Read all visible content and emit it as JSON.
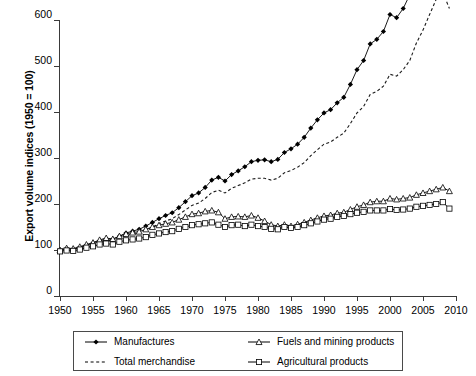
{
  "chart_data": {
    "type": "line",
    "title": "",
    "xlabel": "",
    "ylabel": "Export volume indices (1950 = 100)",
    "xlim": [
      1950,
      2010
    ],
    "ylim": [
      0,
      600
    ],
    "xticks": [
      1950,
      1955,
      1960,
      1965,
      1970,
      1975,
      1980,
      1985,
      1990,
      1995,
      2000,
      2005,
      2010
    ],
    "yticks": [
      0,
      100,
      200,
      300,
      400,
      500,
      600
    ],
    "grid": false,
    "legend_position": "bottom",
    "x": [
      1950,
      1951,
      1952,
      1953,
      1954,
      1955,
      1956,
      1957,
      1958,
      1959,
      1960,
      1961,
      1962,
      1963,
      1964,
      1965,
      1966,
      1967,
      1968,
      1969,
      1970,
      1971,
      1972,
      1973,
      1974,
      1975,
      1976,
      1977,
      1978,
      1979,
      1980,
      1981,
      1982,
      1983,
      1984,
      1985,
      1986,
      1987,
      1988,
      1989,
      1990,
      1991,
      1992,
      1993,
      1994,
      1995,
      1996,
      1997,
      1998,
      1999,
      2000,
      2001,
      2002,
      2003,
      2004,
      2005,
      2006,
      2007,
      2008,
      2009
    ],
    "series": [
      {
        "name": "Manufactures",
        "marker": "filled-diamond",
        "line": "solid",
        "color": "#000000",
        "values": [
          100,
          104,
          103,
          107,
          112,
          118,
          124,
          128,
          126,
          134,
          143,
          149,
          155,
          164,
          178,
          189,
          200,
          208,
          225,
          245,
          263,
          276,
          296,
          325,
          338,
          330,
          352,
          366,
          384,
          404,
          410,
          412,
          408,
          416,
          441,
          456,
          474,
          498,
          533,
          567,
          597,
          614,
          644,
          668,
          718,
          776,
          816,
          892,
          920,
          955,
          1030,
          1020,
          1060,
          1120,
          1230,
          1310,
          1420,
          1510,
          1550,
          1395
        ],
        "values_note": "plotted as index; see plotted_values",
        "plotted_values": [
          100,
          103,
          102,
          105,
          110,
          115,
          120,
          124,
          123,
          130,
          137,
          141,
          145,
          152,
          160,
          168,
          175,
          181,
          192,
          205,
          218,
          224,
          236,
          252,
          258,
          250,
          264,
          272,
          281,
          292,
          295,
          296,
          292,
          297,
          312,
          320,
          330,
          345,
          365,
          383,
          398,
          405,
          420,
          432,
          460,
          492,
          512,
          548,
          558,
          575,
          612,
          605,
          625,
          655,
          708,
          748,
          800,
          845,
          865,
          790
        ]
      },
      {
        "name": "Total merchandise",
        "marker": "none",
        "line": "dashed",
        "color": "#1a1a1a",
        "plotted_values": [
          100,
          103,
          102,
          105,
          109,
          113,
          118,
          121,
          120,
          126,
          131,
          135,
          138,
          143,
          150,
          157,
          163,
          168,
          177,
          187,
          197,
          202,
          212,
          225,
          230,
          224,
          234,
          240,
          246,
          254,
          256,
          256,
          252,
          256,
          268,
          273,
          280,
          290,
          305,
          318,
          330,
          335,
          345,
          354,
          375,
          398,
          412,
          438,
          445,
          456,
          482,
          478,
          492,
          512,
          550,
          578,
          612,
          645,
          660,
          625
        ]
      },
      {
        "name": "Fuels and mining products",
        "marker": "open-triangle",
        "line": "solid",
        "color": "#000000",
        "plotted_values": [
          100,
          104,
          103,
          107,
          112,
          116,
          122,
          126,
          124,
          130,
          135,
          138,
          140,
          145,
          150,
          154,
          157,
          160,
          166,
          172,
          178,
          180,
          184,
          186,
          182,
          168,
          172,
          173,
          172,
          175,
          170,
          163,
          155,
          152,
          155,
          152,
          156,
          160,
          165,
          170,
          174,
          176,
          180,
          182,
          188,
          194,
          198,
          204,
          206,
          206,
          212,
          210,
          212,
          214,
          220,
          224,
          228,
          232,
          236,
          228
        ]
      },
      {
        "name": "Agricultural products",
        "marker": "open-square",
        "line": "solid",
        "color": "#000000",
        "plotted_values": [
          97,
          99,
          98,
          101,
          105,
          108,
          112,
          114,
          112,
          118,
          121,
          123,
          125,
          128,
          133,
          136,
          139,
          141,
          146,
          150,
          154,
          156,
          158,
          160,
          155,
          150,
          154,
          155,
          152,
          155,
          152,
          150,
          146,
          145,
          150,
          148,
          150,
          154,
          158,
          162,
          166,
          168,
          172,
          174,
          178,
          181,
          183,
          186,
          186,
          186,
          189,
          187,
          188,
          190,
          194,
          196,
          198,
          200,
          204,
          190
        ]
      }
    ],
    "annotations": []
  },
  "legend": {
    "entries": [
      {
        "label": "Manufactures",
        "symbol": "filled-diamond-line"
      },
      {
        "label": "Fuels and mining products",
        "symbol": "open-triangle-line"
      },
      {
        "label": "Total merchandise",
        "symbol": "dashed-line"
      },
      {
        "label": "Agricultural products",
        "symbol": "open-square-line"
      }
    ]
  }
}
